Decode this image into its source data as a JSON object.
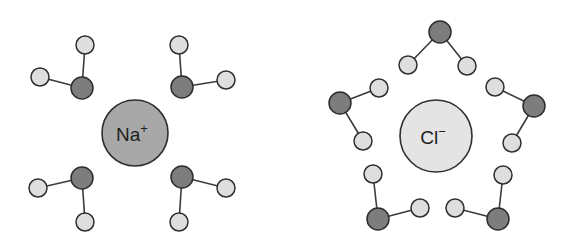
{
  "figure": {
    "background_color": "#ffffff",
    "width": 573,
    "height": 250
  },
  "colors": {
    "oxygen_fill": "#7d7d7d",
    "hydrogen_fill": "#dedede",
    "sodium_ion_fill": "#a8a8a8",
    "chloride_ion_fill": "#e4e4e4",
    "outline": "#2e2e2e",
    "bond": "#3b3b3b"
  },
  "chart_data": {
    "type": "diagram",
    "groups": [
      {
        "id": "sodium-hydration-shell",
        "ion": {
          "symbol": "Na",
          "charge": "+",
          "label": "Na⁺",
          "cx": 135,
          "cy": 133,
          "r": 33,
          "fill": "#a8a8a8"
        },
        "water_count": 4,
        "orientation_note": "oxygen atoms point toward the cation",
        "waters": [
          {
            "id": "na-water-top-left",
            "oxygen": {
              "cx": 82,
              "cy": 88,
              "r": 11
            },
            "hydrogens": [
              {
                "cx": 85,
                "cy": 45,
                "r": 9
              },
              {
                "cx": 40,
                "cy": 77,
                "r": 9
              }
            ]
          },
          {
            "id": "na-water-top-right",
            "oxygen": {
              "cx": 182,
              "cy": 87,
              "r": 11
            },
            "hydrogens": [
              {
                "cx": 179,
                "cy": 45,
                "r": 9
              },
              {
                "cx": 226,
                "cy": 80,
                "r": 9
              }
            ]
          },
          {
            "id": "na-water-bottom-left",
            "oxygen": {
              "cx": 82,
              "cy": 178,
              "r": 11
            },
            "hydrogens": [
              {
                "cx": 38,
                "cy": 188,
                "r": 9
              },
              {
                "cx": 85,
                "cy": 222,
                "r": 9
              }
            ]
          },
          {
            "id": "na-water-bottom-right",
            "oxygen": {
              "cx": 182,
              "cy": 177,
              "r": 11
            },
            "hydrogens": [
              {
                "cx": 226,
                "cy": 188,
                "r": 9
              },
              {
                "cx": 179,
                "cy": 222,
                "r": 9
              }
            ]
          }
        ]
      },
      {
        "id": "chloride-hydration-shell",
        "ion": {
          "symbol": "Cl",
          "charge": "−",
          "label": "Cl⁻",
          "cx": 436,
          "cy": 136,
          "r": 36,
          "fill": "#e4e4e4"
        },
        "water_count": 5,
        "orientation_note": "hydrogen atoms point toward the anion",
        "waters": [
          {
            "id": "cl-water-top",
            "oxygen": {
              "cx": 440,
              "cy": 32,
              "r": 11
            },
            "hydrogens": [
              {
                "cx": 408,
                "cy": 65,
                "r": 9
              },
              {
                "cx": 467,
                "cy": 66,
                "r": 9
              }
            ]
          },
          {
            "id": "cl-water-upper-left",
            "oxygen": {
              "cx": 340,
              "cy": 103,
              "r": 11
            },
            "hydrogens": [
              {
                "cx": 379,
                "cy": 88,
                "r": 9
              },
              {
                "cx": 363,
                "cy": 141,
                "r": 9
              }
            ]
          },
          {
            "id": "cl-water-upper-right",
            "oxygen": {
              "cx": 534,
              "cy": 106,
              "r": 11
            },
            "hydrogens": [
              {
                "cx": 495,
                "cy": 87,
                "r": 9
              },
              {
                "cx": 512,
                "cy": 143,
                "r": 9
              }
            ]
          },
          {
            "id": "cl-water-lower-left",
            "oxygen": {
              "cx": 378,
              "cy": 219,
              "r": 11
            },
            "hydrogens": [
              {
                "cx": 373,
                "cy": 174,
                "r": 9
              },
              {
                "cx": 420,
                "cy": 208,
                "r": 9
              }
            ]
          },
          {
            "id": "cl-water-lower-right",
            "oxygen": {
              "cx": 498,
              "cy": 219,
              "r": 11
            },
            "hydrogens": [
              {
                "cx": 503,
                "cy": 175,
                "r": 9
              },
              {
                "cx": 455,
                "cy": 208,
                "r": 9
              }
            ]
          }
        ]
      }
    ]
  }
}
